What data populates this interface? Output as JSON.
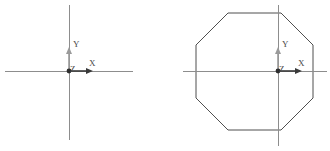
{
  "figures": [
    {
      "id": "axes-only",
      "name": "coordinate-axes-figure",
      "caption": "",
      "origin": {
        "x": 69,
        "y": 71
      },
      "crosshair": {
        "horizontal": {
          "x1": 5,
          "x2": 133,
          "y": 71
        },
        "vertical": {
          "y1": 5,
          "y2": 140,
          "x": 69
        }
      },
      "axes": [
        {
          "key": "x",
          "label": "X",
          "label_x": 89,
          "label_y": 66,
          "dir": "right",
          "length": 24,
          "color": "#3a3a3a"
        },
        {
          "key": "y",
          "label": "Y",
          "label_x": 73,
          "label_y": 47,
          "dir": "up",
          "length": 24,
          "color": "#9a9a9a"
        },
        {
          "key": "z",
          "label": "Z",
          "label_x": 70,
          "label_y": 72,
          "dir": "origin",
          "length": 0,
          "color": "#3a3a3a"
        }
      ],
      "shape": null
    },
    {
      "id": "octagon",
      "name": "octagon-figure",
      "caption": "",
      "origin": {
        "x": 113,
        "y": 71
      },
      "crosshair": {
        "horizontal": {
          "x1": 18,
          "x2": 162,
          "y": 71
        },
        "vertical": {
          "y1": 5,
          "y2": 146,
          "x": 113
        }
      },
      "axes": [
        {
          "key": "x",
          "label": "X",
          "label_x": 133,
          "label_y": 66,
          "dir": "right",
          "length": 24,
          "color": "#3a3a3a"
        },
        {
          "key": "y",
          "label": "Y",
          "label_x": 117,
          "label_y": 47,
          "dir": "up",
          "length": 24,
          "color": "#9a9a9a"
        },
        {
          "key": "z",
          "label": "Z",
          "label_x": 114,
          "label_y": 72,
          "dir": "origin",
          "length": 0,
          "color": "#3a3a3a"
        }
      ],
      "shape": {
        "type": "octagon",
        "sides": 8,
        "points": "63,13 116,13 148,45 148,98 116,130 63,130 31,98 31,45"
      }
    }
  ],
  "style": {
    "background": "#ffffff",
    "crosshair_color": "#8d8d8d",
    "outline_color": "#4f4f4f",
    "x_axis_color": "#3a3a3a",
    "y_axis_color": "#9a9a9a",
    "label_color": "#4a4a4a",
    "origin_color": "#2e2e2e"
  }
}
